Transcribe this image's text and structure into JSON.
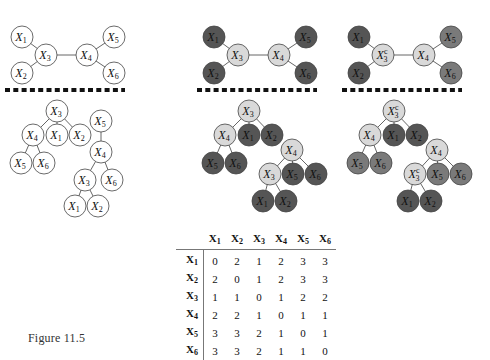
{
  "colors": {
    "white_node": "#ffffff",
    "light_node": "#d9d9d9",
    "dark_node": "#555555",
    "medium_node": "#7a7a7a",
    "edge": "#555555",
    "separator": "#111111"
  },
  "panels": [
    {
      "name": "panel-left",
      "graph_nodes": [
        {
          "id": "X1",
          "base": "X",
          "sub": "1",
          "sup": "",
          "fill": "white"
        },
        {
          "id": "X2",
          "base": "X",
          "sub": "2",
          "sup": "",
          "fill": "white"
        },
        {
          "id": "X3",
          "base": "X",
          "sub": "3",
          "sup": "",
          "fill": "white"
        },
        {
          "id": "X4",
          "base": "X",
          "sub": "4",
          "sup": "",
          "fill": "white"
        },
        {
          "id": "X5",
          "base": "X",
          "sub": "5",
          "sup": "",
          "fill": "white"
        },
        {
          "id": "X6",
          "base": "X",
          "sub": "6",
          "sup": "",
          "fill": "white"
        }
      ],
      "graph_edges": [
        [
          "X1",
          "X3"
        ],
        [
          "X2",
          "X3"
        ],
        [
          "X3",
          "X4"
        ],
        [
          "X4",
          "X5"
        ],
        [
          "X4",
          "X6"
        ]
      ],
      "tree1": {
        "root": "X3",
        "children": {
          "X3": [
            "X4",
            "X1",
            "X2"
          ],
          "X4": [
            "X5",
            "X6"
          ]
        }
      },
      "tree2": {
        "root": "X5",
        "children": {
          "X5": [
            "X4"
          ],
          "X4": [
            "X3",
            "X6"
          ],
          "X3": [
            "X1",
            "X2"
          ]
        }
      }
    },
    {
      "name": "panel-middle",
      "graph_nodes": [
        {
          "id": "X1",
          "base": "X",
          "sub": "1",
          "sup": "",
          "fill": "dark"
        },
        {
          "id": "X2",
          "base": "X",
          "sub": "2",
          "sup": "",
          "fill": "dark"
        },
        {
          "id": "X3",
          "base": "X",
          "sub": "3",
          "sup": "",
          "fill": "light"
        },
        {
          "id": "X4",
          "base": "X",
          "sub": "4",
          "sup": "",
          "fill": "light"
        },
        {
          "id": "X5",
          "base": "X",
          "sub": "5",
          "sup": "",
          "fill": "dark"
        },
        {
          "id": "X6",
          "base": "X",
          "sub": "6",
          "sup": "",
          "fill": "dark"
        }
      ],
      "tree1": {
        "root": "X3",
        "children": {
          "X3": [
            "X4",
            "X1",
            "X2"
          ],
          "X4": [
            "X5",
            "X6"
          ]
        }
      },
      "tree2": {
        "root": "X4",
        "children": {
          "X4": [
            "X3",
            "X5",
            "X6"
          ],
          "X3": [
            "X1",
            "X2"
          ]
        }
      }
    },
    {
      "name": "panel-right",
      "graph_nodes": [
        {
          "id": "X1",
          "base": "X",
          "sub": "1",
          "sup": "",
          "fill": "dark"
        },
        {
          "id": "X2",
          "base": "X",
          "sub": "2",
          "sup": "",
          "fill": "dark"
        },
        {
          "id": "X3c",
          "base": "X",
          "sub": "3",
          "sup": "c",
          "fill": "light"
        },
        {
          "id": "X4",
          "base": "X",
          "sub": "4",
          "sup": "",
          "fill": "light"
        },
        {
          "id": "X5",
          "base": "X",
          "sub": "5",
          "sup": "",
          "fill": "medium"
        },
        {
          "id": "X6",
          "base": "X",
          "sub": "6",
          "sup": "",
          "fill": "medium"
        }
      ],
      "tree1": {
        "root": "X3c",
        "children": {
          "X3c": [
            "X4",
            "X1",
            "X2"
          ],
          "X4": [
            "X5",
            "X6"
          ]
        }
      },
      "tree2": {
        "root": "X4",
        "children": {
          "X4": [
            "X3c",
            "X5",
            "X6"
          ],
          "X3c": [
            "X1",
            "X2"
          ]
        }
      }
    }
  ],
  "table": {
    "headers": [
      {
        "base": "X",
        "sub": "1"
      },
      {
        "base": "X",
        "sub": "2"
      },
      {
        "base": "X",
        "sub": "3"
      },
      {
        "base": "X",
        "sub": "4"
      },
      {
        "base": "X",
        "sub": "5"
      },
      {
        "base": "X",
        "sub": "6"
      }
    ],
    "rows": [
      {
        "label": {
          "base": "X",
          "sub": "1"
        },
        "values": [
          "0",
          "2",
          "1",
          "2",
          "3",
          "3"
        ]
      },
      {
        "label": {
          "base": "X",
          "sub": "2"
        },
        "values": [
          "2",
          "0",
          "1",
          "2",
          "3",
          "3"
        ]
      },
      {
        "label": {
          "base": "X",
          "sub": "3"
        },
        "values": [
          "1",
          "1",
          "0",
          "1",
          "2",
          "2"
        ]
      },
      {
        "label": {
          "base": "X",
          "sub": "4"
        },
        "values": [
          "2",
          "2",
          "1",
          "0",
          "1",
          "1"
        ]
      },
      {
        "label": {
          "base": "X",
          "sub": "5"
        },
        "values": [
          "3",
          "3",
          "2",
          "1",
          "0",
          "1"
        ]
      },
      {
        "label": {
          "base": "X",
          "sub": "6"
        },
        "values": [
          "3",
          "3",
          "2",
          "1",
          "1",
          "0"
        ]
      }
    ]
  },
  "caption": {
    "text": "Figure 11.5"
  }
}
